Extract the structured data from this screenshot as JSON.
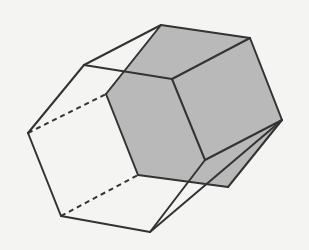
{
  "figure": {
    "title": "",
    "colors": {
      "background": "#f4f4f2",
      "stroke": "#333333",
      "shaded_face": "#b9b9b9"
    },
    "vertices": {
      "A": [
        161,
        25
      ],
      "B": [
        250,
        38
      ],
      "C": [
        282,
        120
      ],
      "D": [
        228,
        187
      ],
      "E": [
        138,
        175
      ],
      "F": [
        106,
        94
      ],
      "G": [
        84,
        65
      ],
      "H": [
        28,
        133
      ],
      "I": [
        61,
        216
      ],
      "J": [
        150,
        232
      ],
      "K": [
        172,
        79
      ],
      "L": [
        205,
        160
      ]
    }
  }
}
